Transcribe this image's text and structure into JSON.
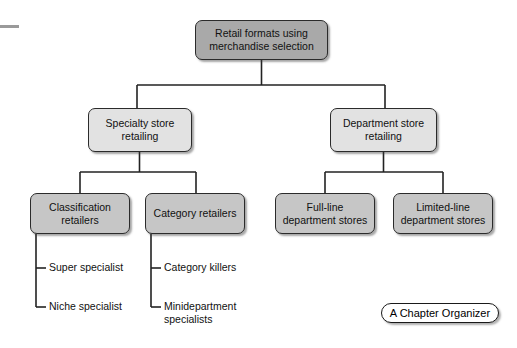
{
  "diagram": {
    "root": {
      "label": "Retail formats using merchandise selection"
    },
    "level2": [
      {
        "label": "Specialty store retailing"
      },
      {
        "label": "Department store retailing"
      }
    ],
    "level3": [
      {
        "label": "Classification retailers"
      },
      {
        "label": "Category retailers"
      },
      {
        "label": "Full-line department stores"
      },
      {
        "label": "Limited-line department stores"
      }
    ],
    "leaves_classification": [
      {
        "label": "Super specialist"
      },
      {
        "label": "Niche specialist"
      }
    ],
    "leaves_category": [
      {
        "label": "Category killers"
      },
      {
        "label": "Minidepartment specialists"
      }
    ],
    "caption": {
      "label": "A Chapter Organizer"
    },
    "colors": {
      "root_fill": "#a9a9a9",
      "level2_fill": "#e2e2e2",
      "level3_fill": "#c6c6c6",
      "border": "#2b2b2b",
      "connector": "#222222",
      "page_background": "#ffffff",
      "corner_dash": "#9a9a9a"
    }
  }
}
